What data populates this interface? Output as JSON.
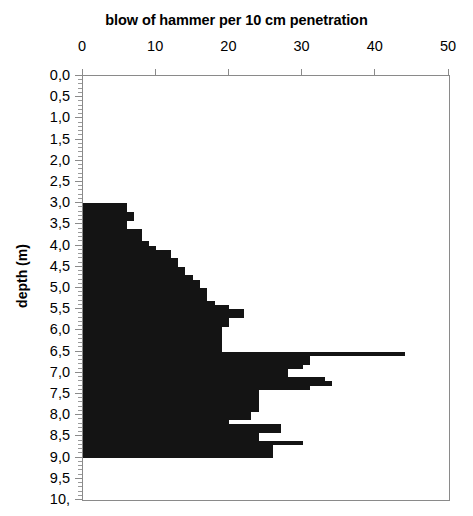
{
  "chart_data": {
    "type": "bar",
    "orientation": "horizontal",
    "title": "blow of hammer per 10 cm penetration",
    "xlabel": "blow of hammer per 10 cm penetration",
    "ylabel": "depth (m)",
    "xlim": [
      0,
      50
    ],
    "ylim": [
      0,
      10
    ],
    "y_inverted": true,
    "grid": false,
    "legend": null,
    "xticks": [
      0,
      10,
      20,
      30,
      40,
      50
    ],
    "xtick_labels": [
      "0",
      "10",
      "20",
      "30",
      "40",
      "50"
    ],
    "yticks": [
      0.0,
      0.5,
      1.0,
      1.5,
      2.0,
      2.5,
      3.0,
      3.5,
      4.0,
      4.5,
      5.0,
      5.5,
      6.0,
      6.5,
      7.0,
      7.5,
      8.0,
      8.5,
      9.0,
      9.5,
      10.0
    ],
    "ytick_labels": [
      "0,0",
      "0,5",
      "1,0",
      "1,5",
      "2,0",
      "2,5",
      "3,0",
      "3,5",
      "4,0",
      "4,5",
      "5,0",
      "5,5",
      "6,0",
      "6,5",
      "7,0",
      "7,5",
      "8,0",
      "8,5",
      "9,0",
      "9,5",
      "10,"
    ],
    "y_minor_step": 0.1,
    "bar_color": "#141414",
    "axis_color": "#8a8a8a",
    "bar_interval_m": 0.1,
    "depth": [
      3.0,
      3.1,
      3.2,
      3.3,
      3.4,
      3.5,
      3.6,
      3.7,
      3.8,
      3.9,
      4.0,
      4.1,
      4.2,
      4.3,
      4.4,
      4.5,
      4.6,
      4.7,
      4.8,
      4.9,
      5.0,
      5.1,
      5.2,
      5.3,
      5.4,
      5.5,
      5.6,
      5.7,
      5.8,
      5.9,
      6.0,
      6.1,
      6.2,
      6.3,
      6.4,
      6.5,
      6.6,
      6.7,
      6.8,
      6.9,
      7.0,
      7.1,
      7.2,
      7.3,
      7.4,
      7.5,
      7.6,
      7.7,
      7.8,
      7.9,
      8.0,
      8.1,
      8.2,
      8.3,
      8.4,
      8.5,
      8.6,
      8.7,
      8.8,
      8.9
    ],
    "values": [
      6,
      6,
      7,
      7,
      6,
      6,
      8,
      8,
      8,
      9,
      10,
      12,
      12,
      13,
      13,
      14,
      14,
      15,
      16,
      16,
      17,
      17,
      17,
      18,
      20,
      22,
      22,
      20,
      20,
      19,
      19,
      19,
      19,
      19,
      19,
      44,
      31,
      31,
      30,
      28,
      28,
      33,
      34,
      31,
      24,
      24,
      24,
      24,
      24,
      23,
      23,
      20,
      27,
      27,
      24,
      24,
      30,
      26,
      26,
      26
    ]
  },
  "axis": {
    "y_title": "depth (m)"
  }
}
